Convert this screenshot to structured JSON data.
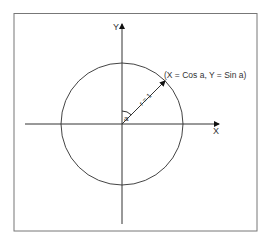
{
  "diagram": {
    "axes": {
      "x_label": "X",
      "y_label": "Y"
    },
    "angle_label": "a",
    "radius_label": "r = 1",
    "point_label": "(X = Cos a, Y = Sin a)",
    "colors": {
      "line": "#333333",
      "border": "#666666",
      "background": "#ffffff"
    }
  }
}
